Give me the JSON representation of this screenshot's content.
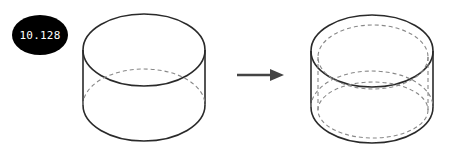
{
  "badge": {
    "label": "10.128"
  },
  "figures": [
    {
      "name": "original-cylinder",
      "description": "open cylinder with hidden bottom edge dashed"
    },
    {
      "name": "result-cylinder",
      "description": "cylinder with inner wall shown as dashed ellipses (shell/thickness)"
    }
  ],
  "arrow": {
    "direction": "right"
  },
  "colors": {
    "stroke": "#2a2a2a",
    "dashed": "#888888",
    "badge_bg": "#000000",
    "badge_text": "#ffffff"
  }
}
